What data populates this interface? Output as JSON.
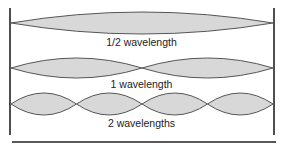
{
  "diagram": {
    "colors": {
      "fill": "#d8d8d8",
      "stroke": "#555555",
      "wall": "#222222"
    },
    "rows": [
      {
        "label": "1/2 wavelength",
        "loops": 1
      },
      {
        "label": "1 wavelength",
        "loops": 2
      },
      {
        "label": "2 wavelengths",
        "loops": 4
      }
    ]
  }
}
